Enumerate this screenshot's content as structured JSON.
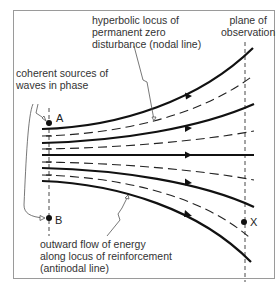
{
  "labels": {
    "hyperbolic": [
      "hyperbolic locus of",
      "permanent zero",
      "disturbance (nodal line)"
    ],
    "plane": [
      "plane of",
      "observation"
    ],
    "sources": [
      "coherent sources of",
      "waves in phase"
    ],
    "outward": [
      "outward flow of energy",
      "along locus of reinforcement",
      "(antinodal line)"
    ]
  },
  "points": {
    "a": "A",
    "b": "B",
    "x": "X"
  },
  "colors": {
    "line": "#111111",
    "dashed": "#222222",
    "leader": "#444444",
    "frame": "#999999",
    "text": "#333333"
  }
}
